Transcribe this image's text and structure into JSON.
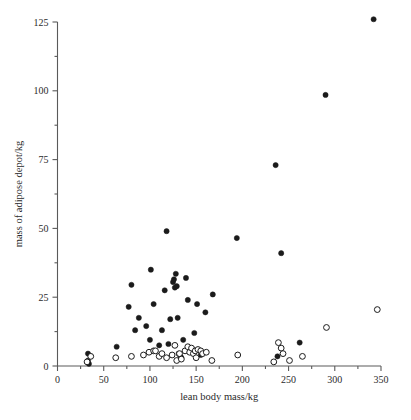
{
  "chart_data": {
    "type": "scatter",
    "title": "",
    "xlabel": "lean body mass/kg",
    "ylabel": "mass of adipose depot/kg",
    "xlim": [
      0,
      350
    ],
    "ylim": [
      0,
      125
    ],
    "xticks": [
      0,
      50,
      100,
      150,
      200,
      250,
      300,
      350
    ],
    "yticks": [
      0,
      25,
      50,
      75,
      100,
      125
    ],
    "xtick_labels": [
      "0",
      "50",
      "100",
      "150",
      "200",
      "250",
      "300",
      "350"
    ],
    "ytick_labels": [
      "0",
      "25",
      "50",
      "75",
      "100",
      "125"
    ],
    "x_minor_ticks": [
      25,
      75,
      125,
      175,
      225,
      275,
      325
    ],
    "y_minor_ticks": [
      12.5,
      37.5,
      62.5,
      87.5,
      112.5
    ],
    "grid": false,
    "legend_position": "none",
    "series": [
      {
        "name": "filled",
        "marker": "filled-circle",
        "color": "#1b1b1b",
        "points": [
          [
            33,
            4.5
          ],
          [
            33,
            2.0
          ],
          [
            34,
            0.8
          ],
          [
            64,
            7.0
          ],
          [
            77,
            21.5
          ],
          [
            80,
            29.5
          ],
          [
            84,
            13.0
          ],
          [
            88,
            17.5
          ],
          [
            96,
            14.5
          ],
          [
            100,
            9.5
          ],
          [
            101,
            35.0
          ],
          [
            104,
            22.5
          ],
          [
            110,
            7.5
          ],
          [
            113,
            13.0
          ],
          [
            116,
            27.5
          ],
          [
            118,
            49.0
          ],
          [
            120,
            8.0
          ],
          [
            122,
            17.0
          ],
          [
            125,
            30.5
          ],
          [
            126,
            31.5
          ],
          [
            127,
            28.5
          ],
          [
            128,
            33.5
          ],
          [
            129,
            29.0
          ],
          [
            130,
            17.5
          ],
          [
            131,
            4.5
          ],
          [
            133,
            3.5
          ],
          [
            134,
            3.0
          ],
          [
            136,
            9.5
          ],
          [
            139,
            32.0
          ],
          [
            141,
            24.0
          ],
          [
            148,
            12.0
          ],
          [
            151,
            22.5
          ],
          [
            155,
            4.0
          ],
          [
            160,
            19.5
          ],
          [
            168,
            26.0
          ],
          [
            194,
            46.5
          ],
          [
            236,
            73.0
          ],
          [
            238,
            3.5
          ],
          [
            242,
            41.0
          ],
          [
            262,
            8.5
          ],
          [
            290,
            98.5
          ],
          [
            342,
            126.0
          ]
        ]
      },
      {
        "name": "open",
        "marker": "open-circle",
        "color": "#1b1b1b",
        "points": [
          [
            32,
            1.5
          ],
          [
            36,
            3.5
          ],
          [
            63,
            3.0
          ],
          [
            80,
            3.5
          ],
          [
            93,
            4.0
          ],
          [
            99,
            5.0
          ],
          [
            104,
            5.5
          ],
          [
            106,
            5.5
          ],
          [
            110,
            3.5
          ],
          [
            113,
            4.5
          ],
          [
            118,
            3.0
          ],
          [
            124,
            4.0
          ],
          [
            127,
            7.5
          ],
          [
            129,
            2.0
          ],
          [
            132,
            4.5
          ],
          [
            134,
            2.5
          ],
          [
            138,
            5.5
          ],
          [
            141,
            7.0
          ],
          [
            143,
            5.0
          ],
          [
            145,
            6.5
          ],
          [
            147,
            4.5
          ],
          [
            149,
            5.5
          ],
          [
            150,
            3.0
          ],
          [
            152,
            6.0
          ],
          [
            155,
            5.5
          ],
          [
            157,
            4.5
          ],
          [
            161,
            5.0
          ],
          [
            167,
            2.0
          ],
          [
            195,
            4.0
          ],
          [
            234,
            1.5
          ],
          [
            239,
            8.5
          ],
          [
            242,
            6.5
          ],
          [
            244,
            4.5
          ],
          [
            251,
            2.0
          ],
          [
            265,
            3.5
          ],
          [
            291,
            14.0
          ],
          [
            346,
            20.5
          ]
        ]
      }
    ]
  },
  "axes": {
    "x_axis_name": "lean body mass/kg",
    "y_axis_name": "mass of adipose depot/kg"
  }
}
